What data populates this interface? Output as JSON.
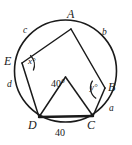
{
  "figure": {
    "type": "circle-geometry-diagram",
    "stroke_color": "#1a1a1a",
    "fill_color": "#ffffff",
    "background": "#ffffff",
    "vertices": [
      {
        "label": "A",
        "x": 71,
        "y": 22,
        "point_x": 71,
        "point_y": 29
      },
      {
        "label": "E",
        "x": 10,
        "y": 62,
        "point_x": 22,
        "point_y": 63
      },
      {
        "label": "B",
        "x": 112,
        "y": 88,
        "point_x": 105,
        "point_y": 88
      },
      {
        "label": "D",
        "x": 32,
        "y": 127,
        "point_x": 39,
        "point_y": 117
      },
      {
        "label": "C",
        "x": 90,
        "y": 127,
        "point_x": 93,
        "point_y": 116
      }
    ],
    "arc_labels": [
      {
        "label": "c",
        "x": 25,
        "y": 30
      },
      {
        "label": "b",
        "x": 104,
        "y": 32
      },
      {
        "label": "d",
        "x": 10,
        "y": 84
      },
      {
        "label": "a",
        "x": 111,
        "y": 108
      }
    ],
    "angle_labels": [
      {
        "label": "x°",
        "x": 31,
        "y": 62,
        "at_vertex": "E"
      },
      {
        "label": "y°",
        "x": 92,
        "y": 87,
        "at_vertex": "B"
      },
      {
        "label": "40°",
        "x": 53,
        "y": 83,
        "at_vertex": "inner-triangle-apex"
      }
    ],
    "side_labels": [
      {
        "label": "40",
        "x": 58,
        "y": 131,
        "for_segment": "DC"
      }
    ]
  }
}
